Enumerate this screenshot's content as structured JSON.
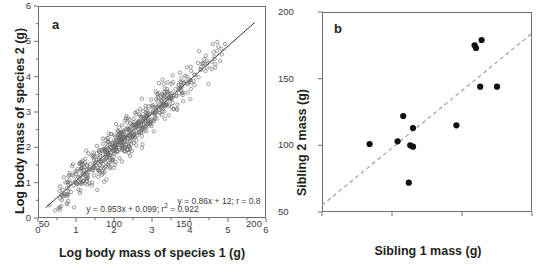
{
  "figure": {
    "width": 556,
    "height": 272,
    "background": "#ffffff",
    "ink_color": "#231f20",
    "axis_color": "#6e6e72"
  },
  "chart_data": [
    {
      "type": "scatter",
      "panel_label": "a",
      "title": "",
      "xlabel": "Log body mass of species 1 (g)",
      "ylabel": "Log body mass of species 2 (g)",
      "xlim": [
        0,
        6
      ],
      "ylim": [
        0,
        6
      ],
      "xticks": [
        0,
        1,
        2,
        3,
        4,
        5,
        6
      ],
      "xtick_labels": [
        "0",
        "1",
        "2",
        "3",
        "4",
        "5",
        "6"
      ],
      "yticks": [
        0,
        1,
        2,
        3,
        4,
        5,
        6
      ],
      "ytick_labels": [
        "0",
        "1",
        "2",
        "3",
        "4",
        "5",
        "6"
      ],
      "minor_ticks": true,
      "grid": false,
      "legend": null,
      "marker": {
        "style": "open-circle",
        "size_px": 3.4,
        "edge_color": "#6b6b70",
        "fill": "none"
      },
      "fit_line": {
        "style": "solid",
        "color": "#1a1a1a",
        "slope": 0.953,
        "intercept": 0.099,
        "x_start": 0.2,
        "x_end": 5.7
      },
      "annotation": {
        "text_before": "y = 0.953x + 0.099; r",
        "superscript": "2",
        "text_after": " = 0.922",
        "x": 2.75,
        "y": 0.42
      },
      "n_points": 620,
      "point_cloud_model": {
        "note": "Points generated along the fitted line with scatter; spec mirrors the plotted cloud.",
        "x_min": 0.25,
        "x_max": 5.05,
        "x_mode": 1.95,
        "residual_sd": 0.24,
        "seed": 20240517
      }
    },
    {
      "type": "scatter",
      "panel_label": "b",
      "title": "",
      "xlabel": "Sibling 1 mass (g)",
      "ylabel": "Sibling 2 mass (g)",
      "xlim": [
        50,
        200
      ],
      "ylim": [
        50,
        200
      ],
      "xticks": [
        50,
        100,
        150,
        200
      ],
      "xtick_labels": [
        "50",
        "100",
        "150",
        "200"
      ],
      "yticks": [
        50,
        100,
        150,
        200
      ],
      "ytick_labels": [
        "50",
        "100",
        "150",
        "200"
      ],
      "minor_ticks": false,
      "grid": false,
      "legend": null,
      "marker": {
        "style": "filled-circle",
        "size_px": 6.2,
        "color": "#111111"
      },
      "fit_line": {
        "style": "dashed",
        "color": "#9a9a9e",
        "slope": 0.86,
        "intercept": 12,
        "x_start": 50,
        "x_end": 200
      },
      "annotation": {
        "text_before": "y = 0.86x + 12; r = 0.8",
        "superscript": "",
        "text_after": "",
        "x": 175,
        "y": 61
      },
      "points": [
        {
          "x": 84,
          "y": 101
        },
        {
          "x": 104,
          "y": 103
        },
        {
          "x": 108,
          "y": 122
        },
        {
          "x": 113,
          "y": 100
        },
        {
          "x": 115,
          "y": 99
        },
        {
          "x": 115,
          "y": 113
        },
        {
          "x": 112,
          "y": 72
        },
        {
          "x": 146,
          "y": 115
        },
        {
          "x": 159,
          "y": 175
        },
        {
          "x": 160,
          "y": 173
        },
        {
          "x": 164,
          "y": 179
        },
        {
          "x": 163,
          "y": 144
        },
        {
          "x": 175,
          "y": 144
        }
      ],
      "n_points": 13
    }
  ]
}
